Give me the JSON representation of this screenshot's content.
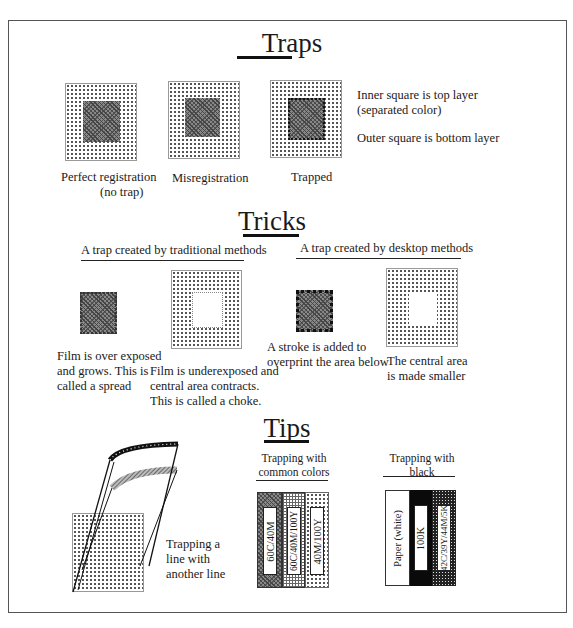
{
  "sections": {
    "traps": {
      "title": "Traps",
      "items": [
        {
          "caption_line1": "Perfect registration",
          "caption_line2": "(no trap)"
        },
        {
          "caption_line1": "Misregistration"
        },
        {
          "caption_line1": "Trapped"
        }
      ],
      "legend": {
        "line1": "Inner square is top layer",
        "line2": "(separated color)",
        "line3": "Outer square is bottom layer"
      }
    },
    "tricks": {
      "title": "Tricks",
      "traditional_heading": "A trap created by traditional methods",
      "desktop_heading": "A trap created by desktop methods",
      "captions": {
        "spread": [
          "Film is over exposed",
          "and grows. This is",
          "called a spread"
        ],
        "choke": [
          "Film is underexposed and",
          "central  area contracts.",
          "This is called a choke."
        ],
        "stroke": [
          "A stroke is added to",
          "overprint the area below"
        ],
        "smaller": [
          "The central area",
          "is made smaller"
        ]
      }
    },
    "tips": {
      "title": "Tips",
      "line_caption": [
        "Trapping a",
        "line with",
        "another line"
      ],
      "common_colors": {
        "heading": [
          "Trapping with",
          "common colors"
        ],
        "bars": [
          "60C/40M",
          "60C/40M/100Y",
          "40M/100Y"
        ]
      },
      "black": {
        "heading": [
          "Trapping with",
          "black"
        ],
        "bars": [
          "Paper (white)",
          "100K",
          "42C/39Y/44M/5K"
        ]
      }
    }
  },
  "colors": {
    "ink": "#1a1a1a",
    "frame": "#555555",
    "background": "#ffffff"
  }
}
